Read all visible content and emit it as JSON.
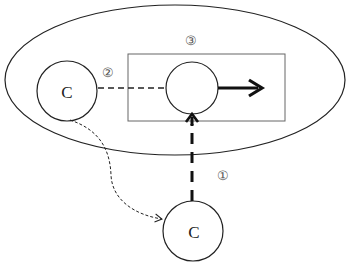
{
  "diagram": {
    "outer_region": {
      "shape": "ellipse"
    },
    "inner_box": {
      "shape": "rectangle",
      "label": "③"
    },
    "nodes": [
      {
        "id": "left-c",
        "label": "C"
      },
      {
        "id": "center",
        "label": ""
      },
      {
        "id": "bottom-c",
        "label": "C"
      }
    ],
    "edges": [
      {
        "id": "edge-1",
        "label": "①",
        "from": "bottom-c",
        "to": "center",
        "style": "thick-dashed-arrow"
      },
      {
        "id": "edge-2",
        "label": "②",
        "from": "left-c",
        "to": "center",
        "style": "dashed-line"
      },
      {
        "id": "edge-curve",
        "label": "",
        "from": "left-c",
        "to": "bottom-c",
        "style": "dotted-curved-arrow"
      },
      {
        "id": "edge-out",
        "label": "",
        "from": "center",
        "to": "right",
        "style": "thick-solid-arrow"
      }
    ],
    "colors": {
      "stroke": "#222222",
      "box_stroke": "#666666",
      "label": "#555555"
    }
  }
}
